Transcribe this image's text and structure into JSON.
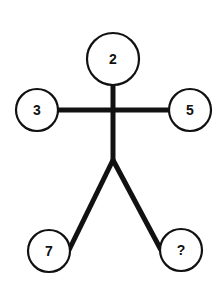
{
  "diagram": {
    "type": "stick-figure number puzzle",
    "colors": {
      "stroke": "#111111",
      "background": "#ffffff"
    },
    "nodes": {
      "head": {
        "label": "2",
        "cx": 113,
        "cy": 59,
        "r": 26
      },
      "left_hand": {
        "label": "3",
        "cx": 37,
        "cy": 110,
        "r": 21
      },
      "right_hand": {
        "label": "5",
        "cx": 190,
        "cy": 110,
        "r": 21
      },
      "left_foot": {
        "label": "7",
        "cx": 49,
        "cy": 251,
        "r": 21
      },
      "right_foot": {
        "label": "?",
        "cx": 181,
        "cy": 250,
        "r": 21
      }
    }
  }
}
